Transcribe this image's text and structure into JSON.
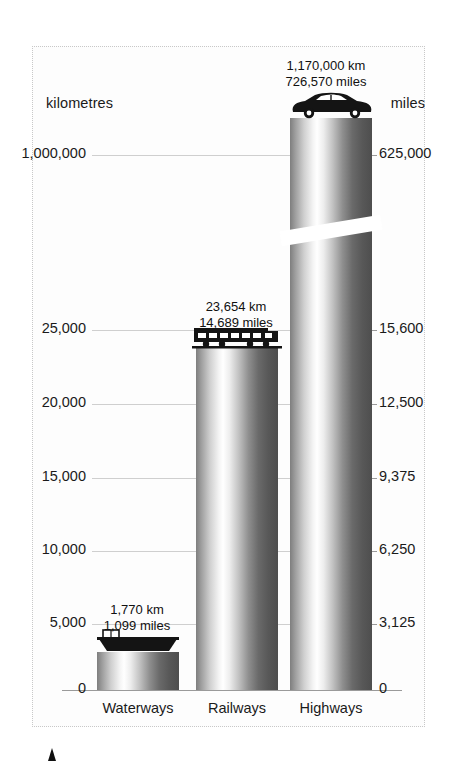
{
  "chart_data": {
    "type": "bar",
    "title": "",
    "subtitle": "",
    "categories": [
      "Waterways",
      "Railways",
      "Highways"
    ],
    "series": [
      {
        "name": "kilometres",
        "unit": "km",
        "values": [
          1770,
          23654,
          1170000
        ],
        "axis": "left"
      },
      {
        "name": "miles",
        "unit": "miles",
        "values": [
          1099,
          14689,
          726570
        ],
        "axis": "right"
      }
    ],
    "data_labels": [
      {
        "category": "Waterways",
        "km": "1,770 km",
        "miles": "1,099 miles",
        "icon": "barge-icon"
      },
      {
        "category": "Railways",
        "km": "23,654 km",
        "miles": "14,689 miles",
        "icon": "tram-icon"
      },
      {
        "category": "Highways",
        "km": "1,170,000 km",
        "miles": "726,570 miles",
        "icon": "car-icon"
      }
    ],
    "axes": {
      "left": {
        "label": "kilometres",
        "ticks": [
          "1,000,000",
          "25,000",
          "20,000",
          "15,000",
          "10,000",
          "5,000",
          "0"
        ],
        "tick_values": [
          1000000,
          25000,
          20000,
          15000,
          10000,
          5000,
          0
        ],
        "broken_axis": true
      },
      "right": {
        "label": "miles",
        "ticks": [
          "625,000",
          "15,600",
          "12,500",
          "9,375",
          "6,250",
          "3,125",
          "0"
        ],
        "tick_values": [
          625000,
          15600,
          12500,
          9375,
          6250,
          3125,
          0
        ],
        "broken_axis": true
      }
    },
    "xlabel": "",
    "ylabel": "kilometres",
    "grid": true,
    "legend_position": "none"
  },
  "axis_captions": {
    "left": "kilometres",
    "right": "miles"
  },
  "left_ticks": [
    {
      "label": "1,000,000",
      "y": 155
    },
    {
      "label": "25,000",
      "y": 330
    },
    {
      "label": "20,000",
      "y": 404
    },
    {
      "label": "15,000",
      "y": 478
    },
    {
      "label": "10,000",
      "y": 551
    },
    {
      "label": "5,000",
      "y": 624
    },
    {
      "label": "0",
      "y": 690
    }
  ],
  "right_ticks": [
    {
      "label": "625,000",
      "y": 155
    },
    {
      "label": "15,600",
      "y": 330
    },
    {
      "label": "12,500",
      "y": 404
    },
    {
      "label": "9,375",
      "y": 478
    },
    {
      "label": "6,250",
      "y": 551
    },
    {
      "label": "3,125",
      "y": 624
    },
    {
      "label": "0",
      "y": 690
    }
  ],
  "bars": [
    {
      "name": "Waterways",
      "left": 97,
      "width": 82,
      "top": 652,
      "height": 38,
      "icon": "barge-icon"
    },
    {
      "name": "Railways",
      "left": 196,
      "width": 82,
      "top": 348,
      "height": 342,
      "icon": "tram-icon"
    },
    {
      "name": "Highways",
      "left": 290,
      "width": 82,
      "top": 118,
      "height": 572,
      "icon": "car-icon"
    }
  ],
  "value_labels": [
    {
      "name": "Waterways",
      "line1": "1,770 km",
      "line2": "1,099 miles",
      "left": 67,
      "top": 602
    },
    {
      "name": "Railways",
      "line1": "23,654 km",
      "line2": "14,689 miles",
      "left": 166,
      "top": 299
    },
    {
      "name": "Highways",
      "line1": "1,170,000 km",
      "line2": "726,570 miles",
      "left": 256,
      "top": 58
    }
  ],
  "category_labels": [
    {
      "label": "Waterways",
      "left": 78,
      "width": 120
    },
    {
      "label": "Railways",
      "left": 177,
      "width": 120
    },
    {
      "label": "Highways",
      "left": 271,
      "width": 120
    }
  ],
  "colors": {
    "background": "#ffffff",
    "panel": "#fdfdfd",
    "frame": "#c8c8c8",
    "gridline": "#cfcfcf",
    "baseline": "#9a9a9a",
    "bar_light": "#ffffff",
    "bar_dark": "#4e4e4e",
    "text": "#1a1a1a",
    "icon": "#141414"
  },
  "icons": {
    "barge": "barge-icon",
    "tram": "tram-icon",
    "car": "car-icon",
    "source_mark": "triangle-marker-icon"
  }
}
